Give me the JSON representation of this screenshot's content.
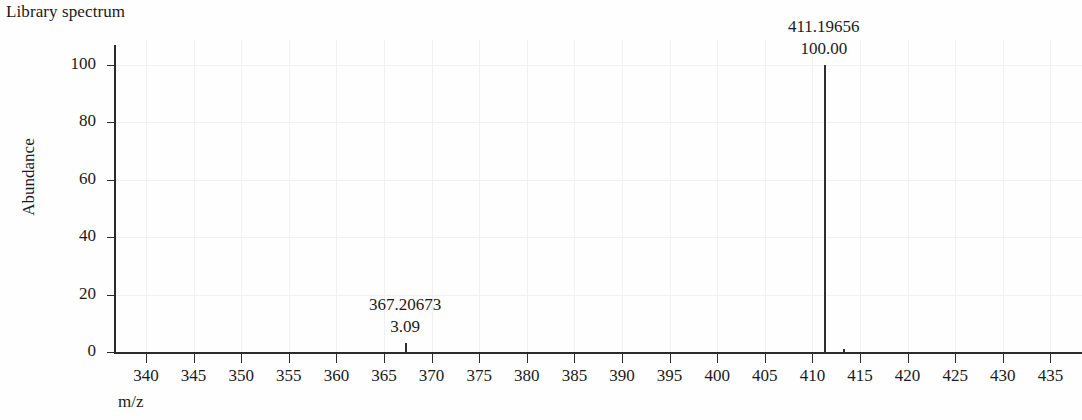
{
  "title": "Library spectrum",
  "axes": {
    "ylabel": "Abundance",
    "xlabel": "m/z",
    "yticks": [
      "0",
      "20",
      "40",
      "60",
      "80",
      "100"
    ],
    "xticks": [
      "340",
      "345",
      "350",
      "355",
      "360",
      "365",
      "370",
      "375",
      "380",
      "385",
      "390",
      "395",
      "400",
      "405",
      "410",
      "415",
      "420",
      "425",
      "430",
      "435"
    ]
  },
  "peaks": [
    {
      "mz_label": "367.20673",
      "abundance_label": "3.09"
    },
    {
      "mz_label": "411.19656",
      "abundance_label": "100.00"
    }
  ],
  "chart_data": {
    "type": "bar",
    "title": "Library spectrum",
    "xlabel": "m/z",
    "ylabel": "Abundance",
    "xlim": [
      336,
      438
    ],
    "ylim": [
      0,
      107
    ],
    "grid": true,
    "legend": "none",
    "xticks": [
      340,
      345,
      350,
      355,
      360,
      365,
      370,
      375,
      380,
      385,
      390,
      395,
      400,
      405,
      410,
      415,
      420,
      425,
      430,
      435
    ],
    "yticks": [
      0,
      20,
      40,
      60,
      80,
      100
    ],
    "x": [
      367.20673,
      411.19656,
      413.2
    ],
    "values": [
      3.09,
      100.0,
      1.2
    ],
    "annotations": [
      {
        "x": 367.20673,
        "y": 3.09,
        "mz_text": "367.20673",
        "abundance_text": "3.09"
      },
      {
        "x": 411.19656,
        "y": 100.0,
        "mz_text": "411.19656",
        "abundance_text": "100.00"
      }
    ]
  },
  "colors": {
    "peak": "#2f2f2f",
    "axis": "#2b2b2b",
    "grid": "#f1f1f3",
    "background": "#fefefe",
    "text": "#1a1a1a"
  }
}
